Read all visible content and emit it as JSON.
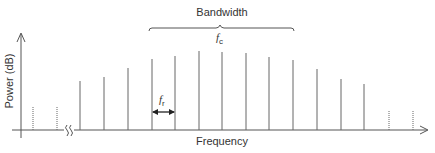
{
  "diagram": {
    "title_brace_label": "Bandwidth",
    "center_label": "f",
    "center_label_sub": "c",
    "spacing_label": "f",
    "spacing_label_sub": "r",
    "x_axis_label": "Frequency",
    "y_axis_label": "Power (dB)",
    "colors": {
      "line": "#666666",
      "axis": "#555555",
      "text": "#333333"
    }
  },
  "chart_data": {
    "type": "bar",
    "title": "",
    "xlabel": "Frequency",
    "ylabel": "Power (dB)",
    "lines": [
      {
        "x": 33,
        "height": 24,
        "style": "dotted"
      },
      {
        "x": 57,
        "height": 23,
        "style": "dotted"
      },
      {
        "x": 80,
        "height": 49,
        "style": "solid"
      },
      {
        "x": 104,
        "height": 53,
        "style": "solid"
      },
      {
        "x": 128,
        "height": 62,
        "style": "solid"
      },
      {
        "x": 152,
        "height": 71,
        "style": "solid"
      },
      {
        "x": 175,
        "height": 74,
        "style": "solid"
      },
      {
        "x": 199,
        "height": 79,
        "style": "solid"
      },
      {
        "x": 222,
        "height": 78,
        "style": "solid"
      },
      {
        "x": 246,
        "height": 77,
        "style": "solid"
      },
      {
        "x": 269,
        "height": 73,
        "style": "solid"
      },
      {
        "x": 293,
        "height": 70,
        "style": "solid"
      },
      {
        "x": 317,
        "height": 61,
        "style": "solid"
      },
      {
        "x": 341,
        "height": 51,
        "style": "solid"
      },
      {
        "x": 364,
        "height": 46,
        "style": "solid"
      },
      {
        "x": 389,
        "height": 20,
        "style": "dotted"
      },
      {
        "x": 413,
        "height": 20,
        "style": "dotted"
      }
    ],
    "annotations": [
      "Bandwidth",
      "f_c",
      "f_r"
    ],
    "grid": false,
    "legend": null
  }
}
